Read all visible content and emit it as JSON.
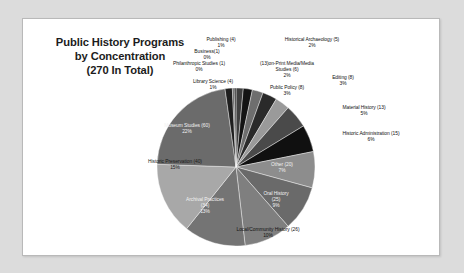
{
  "chart": {
    "title_lines": [
      "Public History Programs",
      "by Concentration",
      "(270 In Total)"
    ],
    "total": 270
  },
  "chart_data": {
    "type": "pie",
    "title": "Public History Programs by Concentration (270 In Total)",
    "total": 270,
    "units": "programs",
    "legend": "none (direct labels)",
    "start_angle_deg": 0,
    "direction": "clockwise",
    "categories": [
      "Library Science (4)",
      "Historical Archaeology (5)",
      "Non-Print Media/Media Studies (6)",
      "Editing (8)",
      "Public Policy (8)",
      "Material History (13)",
      "Historic Administration (15)",
      "Other (20)",
      "Oral History (25)",
      "Local/Community History (26)",
      "Archival Practices (34)",
      "Historic Preservation (40)",
      "Museum Studies (60)",
      "Publishing (4)",
      "Business (1)",
      "Philanthropic Studies (1)"
    ],
    "values": [
      4,
      5,
      6,
      8,
      8,
      13,
      15,
      20,
      25,
      26,
      34,
      40,
      60,
      4,
      1,
      1
    ],
    "percents": [
      1,
      2,
      2,
      3,
      3,
      5,
      6,
      7,
      9,
      10,
      13,
      15,
      22,
      1,
      0,
      0
    ],
    "slices": [
      {
        "name": "Library Science",
        "count": 4,
        "percent": 1,
        "color": "#3f3f3f"
      },
      {
        "name": "Historical Archaeology",
        "count": 5,
        "percent": 2,
        "color": "#141414"
      },
      {
        "name": "Non-Print Media/Media Studies",
        "count": 6,
        "percent": 2,
        "color": "#6e6e6e"
      },
      {
        "name": "Editing",
        "count": 8,
        "percent": 3,
        "color": "#2a2a2a"
      },
      {
        "name": "Public Policy",
        "count": 8,
        "percent": 3,
        "color": "#9a9a9a"
      },
      {
        "name": "Material History",
        "count": 13,
        "percent": 5,
        "color": "#4a4a4a"
      },
      {
        "name": "Historic Administration",
        "count": 15,
        "percent": 6,
        "color": "#101010"
      },
      {
        "name": "Other",
        "count": 20,
        "percent": 7,
        "color": "#8d8d8d"
      },
      {
        "name": "Oral History",
        "count": 25,
        "percent": 9,
        "color": "#6a6a6a"
      },
      {
        "name": "Local/Community History",
        "count": 26,
        "percent": 10,
        "color": "#7f7f7f"
      },
      {
        "name": "Archival Practices",
        "count": 34,
        "percent": 13,
        "color": "#747474"
      },
      {
        "name": "Historic Preservation",
        "count": 40,
        "percent": 15,
        "color": "#a8a8a8"
      },
      {
        "name": "Museum Studies",
        "count": 60,
        "percent": 22,
        "color": "#6b6b6b"
      },
      {
        "name": "Publishing",
        "count": 4,
        "percent": 1,
        "color": "#1f1f1f"
      },
      {
        "name": "Business",
        "count": 1,
        "percent": 0,
        "color": "#555555"
      },
      {
        "name": "Philanthropic Studies",
        "count": 1,
        "percent": 0,
        "color": "#2f2f2f"
      }
    ]
  },
  "labels": {
    "publishing": {
      "name": "Publishing (4)",
      "pct": "1%"
    },
    "business": {
      "name": "Business(1)",
      "pct": "0%"
    },
    "philanthropic": {
      "name": "Philanthropic Studies (1)",
      "pct": "0%"
    },
    "library_science": {
      "name": "Library Science (4)",
      "pct": "1%"
    },
    "hist_archaeology": {
      "name": "Historical Archaeology (5)",
      "pct": "2%"
    },
    "nonprint": {
      "name": "(13)on-Print Media/Media",
      "name2": "Studies (6)",
      "pct": "2%"
    },
    "editing": {
      "name": "Editing  (8)",
      "pct": "3%"
    },
    "public_policy": {
      "name": "Public Policy (8)",
      "pct": "3%"
    },
    "material_history": {
      "name": "Material History (13)",
      "pct": "5%"
    },
    "hist_admin": {
      "name": "Historic Administration  (15)",
      "pct": "6%"
    },
    "other": {
      "name": "Other (20)",
      "pct": "7%"
    },
    "oral_history": {
      "name": "Oral History",
      "name2": "(25)",
      "pct": "9%"
    },
    "local_community": {
      "name": "Local/Community History (26)",
      "pct": "10%"
    },
    "archival": {
      "name": "Archival Practices",
      "name2": "(34)",
      "pct": "13%"
    },
    "historic_pres": {
      "name": "Historic Preservation (40)",
      "pct": "15%"
    },
    "museum_studies": {
      "name": "Museum Studies (60)",
      "pct": "22%"
    }
  }
}
